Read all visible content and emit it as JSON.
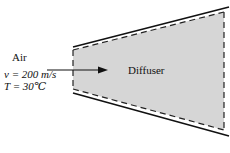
{
  "diagram": {
    "type": "diffuser-schematic",
    "inlet": {
      "fluid_label": "Air",
      "velocity_label": "v = 200 m/s",
      "temperature_label": "T = 30℃"
    },
    "device_label": "Diffuser",
    "colors": {
      "fill": "#d6d6d6",
      "stroke": "#111111",
      "background": "#ffffff"
    }
  }
}
